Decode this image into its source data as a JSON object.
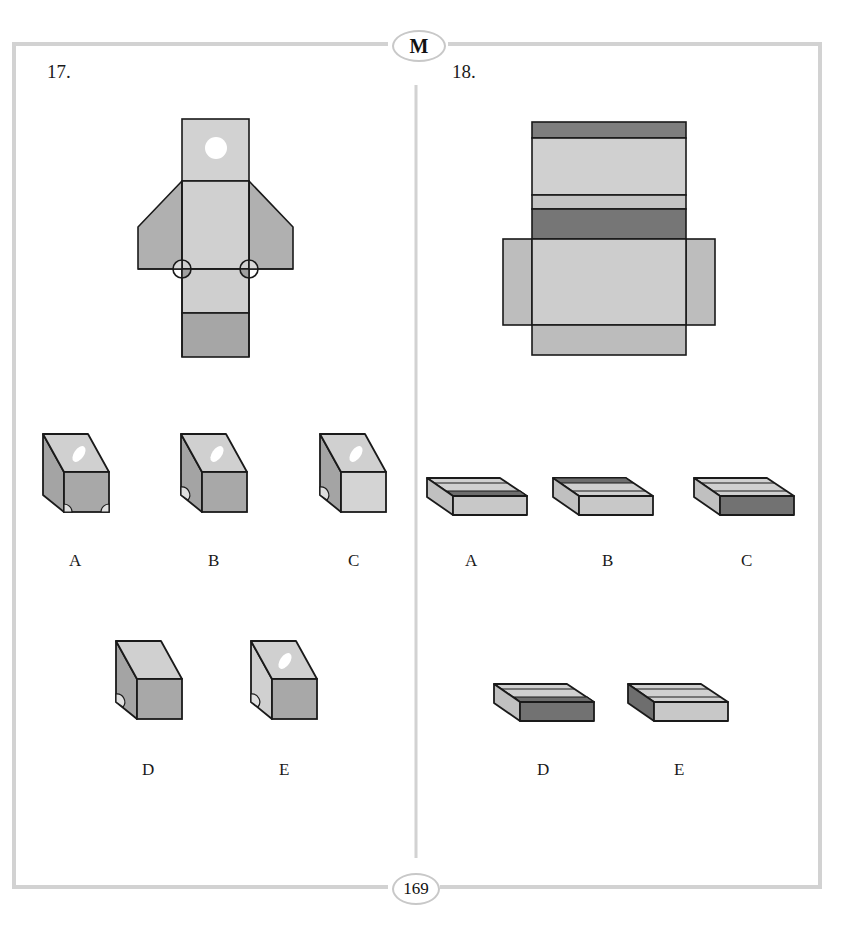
{
  "header": {
    "section_badge": "M"
  },
  "footer": {
    "page_number": "169"
  },
  "colors": {
    "frame": "#d0d0d0",
    "light": "#cfcfcf",
    "mid": "#b4b4b4",
    "dark": "#7c7c7c",
    "outline": "#1a1a1a"
  },
  "questions": [
    {
      "number": "17.",
      "figure": "net-with-hole-and-semicircles",
      "options": [
        "A",
        "B",
        "C",
        "D",
        "E"
      ]
    },
    {
      "number": "18.",
      "figure": "flat-box-net-with-dark-stripes",
      "options": [
        "A",
        "B",
        "C",
        "D",
        "E"
      ]
    }
  ]
}
